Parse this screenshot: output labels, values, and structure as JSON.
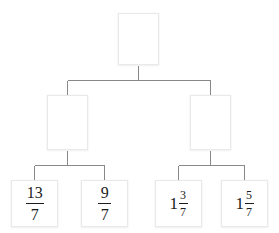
{
  "diagram": {
    "type": "binary-tree",
    "title": "",
    "levels": 3,
    "colors": {
      "background": "#ffffff",
      "box_border": "#e9e9e9",
      "box_fill": "#ffffff",
      "connector": "#888888",
      "text": "#1c1c1c"
    },
    "nodes": {
      "root": {
        "id": "root",
        "label": "",
        "empty": true
      },
      "middle": [
        {
          "id": "mid-left",
          "label": "",
          "empty": true
        },
        {
          "id": "mid-right",
          "label": "",
          "empty": true
        }
      ],
      "leaves": [
        {
          "id": "leaf-1",
          "empty": false,
          "format": "improper-fraction",
          "whole": "",
          "numerator": "13",
          "denominator": "7",
          "text": "13/7"
        },
        {
          "id": "leaf-2",
          "empty": false,
          "format": "improper-fraction",
          "whole": "",
          "numerator": "9",
          "denominator": "7",
          "text": "9/7"
        },
        {
          "id": "leaf-3",
          "empty": false,
          "format": "mixed-number",
          "whole": "1",
          "numerator": "3",
          "denominator": "7",
          "text": "1 3/7"
        },
        {
          "id": "leaf-4",
          "empty": false,
          "format": "mixed-number",
          "whole": "1",
          "numerator": "5",
          "denominator": "7",
          "text": "1 5/7"
        }
      ]
    }
  }
}
